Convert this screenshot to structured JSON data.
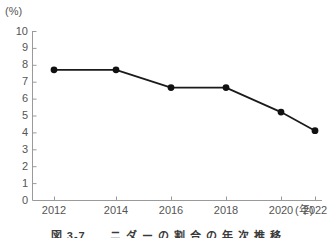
{
  "chart_data": {
    "type": "line",
    "title": "",
    "categories": [
      "2012",
      "2014",
      "2016",
      "2018",
      "2020",
      "2022"
    ],
    "x": [
      2012,
      2014,
      2016,
      2018,
      2020,
      2022
    ],
    "values": [
      7.7,
      7.7,
      6.65,
      6.65,
      5.2,
      4.1
    ],
    "series": [
      {
        "name": "",
        "values": [
          7.7,
          7.7,
          6.65,
          6.65,
          5.2,
          4.1
        ]
      }
    ],
    "xlabel": "(年)",
    "ylabel": "(%)",
    "ylim": [
      0,
      10
    ],
    "xlim": [
      2011,
      2023
    ],
    "y_ticks": [
      "10",
      "9",
      "8",
      "7",
      "6",
      "5",
      "4",
      "3",
      "2",
      "1",
      "0"
    ],
    "y_tick_values": [
      10,
      9,
      8,
      7,
      6,
      5,
      4,
      3,
      2,
      1,
      0
    ],
    "x_ticks": [
      "2012",
      "2014",
      "2016",
      "2018",
      "2020",
      "2022"
    ],
    "grid": false,
    "legend": false,
    "marker": "filled-circle",
    "line_color": "#1a1a1a",
    "marker_color": "#111111",
    "axis_color": "#999999",
    "text_color": "#555555",
    "background": "#ffffff"
  },
  "axes": {
    "y_unit": "(%)",
    "x_unit": "(年)"
  },
  "caption": {
    "text": "図 3-7　　ニ ダ ー の 割 合 の 年 次 推 移"
  }
}
